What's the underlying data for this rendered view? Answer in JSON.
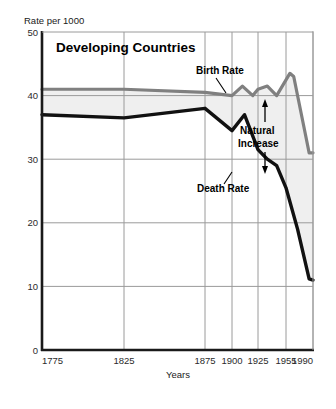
{
  "chart_data": {
    "type": "line",
    "title": "Developing Countries",
    "ylabel": "Rate per 1000",
    "xlabel": "Years",
    "ylim": [
      0,
      50
    ],
    "yticks": [
      0,
      10,
      20,
      30,
      40,
      50
    ],
    "xticks": [
      1775,
      1825,
      1875,
      1900,
      1925,
      1955,
      1990
    ],
    "xtick_labels": [
      "1775",
      "1825",
      "1875",
      "1900",
      "1925",
      "1955",
      "1990"
    ],
    "grid": true,
    "legend_position": "inline-annotations",
    "shaded_region": {
      "label": "Natural Increase",
      "between": [
        "Birth Rate",
        "Death Rate"
      ],
      "color": "#efefef"
    },
    "annotations": [
      {
        "text": "Birth Rate",
        "x": 1930,
        "y": 45.5
      },
      {
        "text": "Death Rate",
        "x": 1922,
        "y": 26.5
      },
      {
        "text": "Natural Increase",
        "x": 1948,
        "y": 35.0
      }
    ],
    "series": [
      {
        "name": "Birth Rate",
        "color": "#808080",
        "x": [
          1775,
          1825,
          1875,
          1900,
          1910,
          1920,
          1925,
          1935,
          1945,
          1960,
          1965,
          1980,
          1985,
          1990
        ],
        "values": [
          41.0,
          41.0,
          40.5,
          40.0,
          41.5,
          40.0,
          41.0,
          41.5,
          40.0,
          43.5,
          43.0,
          34.0,
          31.0,
          31.0
        ]
      },
      {
        "name": "Death Rate",
        "color": "#111111",
        "x": [
          1775,
          1825,
          1875,
          1900,
          1912,
          1925,
          1935,
          1945,
          1955,
          1970,
          1985,
          1990
        ],
        "values": [
          37.0,
          36.5,
          38.0,
          34.5,
          37.0,
          31.5,
          30.0,
          29.0,
          25.5,
          19.0,
          11.2,
          11.0
        ]
      }
    ]
  },
  "axis": {
    "ylabel": "Rate per 1000",
    "xlabel": "Years",
    "ytick_labels": [
      "50",
      "40",
      "30",
      "20",
      "10",
      "0"
    ],
    "xtick_labels": [
      "1775",
      "1825",
      "1875",
      "1900",
      "1925",
      "1955",
      "1990"
    ]
  },
  "labels": {
    "title": "Developing Countries",
    "birth_rate": "Birth Rate",
    "death_rate": "Death Rate",
    "natural_increase_line1": "Natural",
    "natural_increase_line2": "Increase"
  },
  "colors": {
    "birth_rate": "#808080",
    "death_rate": "#111111",
    "fill": "#efefef",
    "grid": "#9a9a9a",
    "axis": "#1a1a1a"
  }
}
